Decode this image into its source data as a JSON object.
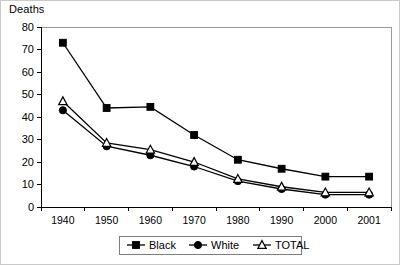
{
  "figure": {
    "y_axis_title": "Deaths",
    "background_color": "#ffffff",
    "line_color": "#000000",
    "frame_color": "#9a9a9a"
  },
  "chart_data": {
    "type": "line",
    "title": "",
    "xlabel": "",
    "ylabel": "Deaths",
    "categories": [
      "1940",
      "1950",
      "1960",
      "1970",
      "1980",
      "1990",
      "2000",
      "2001"
    ],
    "ylim": [
      0,
      80
    ],
    "yticks": [
      0,
      10,
      20,
      30,
      40,
      50,
      60,
      70,
      80
    ],
    "grid": false,
    "legend_position": "bottom",
    "series": [
      {
        "name": "Black",
        "marker": "filled-square",
        "values": [
          73,
          44,
          44.5,
          32,
          21,
          17,
          13.5,
          13.5
        ]
      },
      {
        "name": "White",
        "marker": "filled-circle",
        "values": [
          43,
          27,
          23,
          18,
          11.5,
          8,
          5.5,
          5.5
        ]
      },
      {
        "name": "TOTAL",
        "marker": "open-triangle",
        "values": [
          47,
          28.5,
          25.5,
          20,
          12.5,
          9,
          6.5,
          6.5
        ]
      }
    ]
  },
  "legend": {
    "items": [
      {
        "label": "Black",
        "marker": "filled-square"
      },
      {
        "label": "White",
        "marker": "filled-circle"
      },
      {
        "label": "TOTAL",
        "marker": "open-triangle"
      }
    ]
  }
}
